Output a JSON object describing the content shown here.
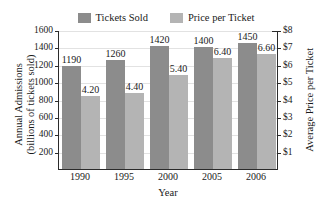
{
  "chart_data": {
    "type": "bar",
    "title": "",
    "xlabel": "Year",
    "categories": [
      "1990",
      "1995",
      "2000",
      "2005",
      "2006"
    ],
    "series": [
      {
        "name": "Tickets Sold",
        "axis": "left",
        "color": "#8c8c8c",
        "values": [
          1190,
          1260,
          1420,
          1400,
          1450
        ],
        "labels": [
          "1190",
          "1260",
          "1420",
          "1400",
          "1450"
        ]
      },
      {
        "name": "Price per Ticket",
        "axis": "right",
        "color": "#b4b4b4",
        "values": [
          4.2,
          4.4,
          5.4,
          6.4,
          6.6
        ],
        "labels": [
          "4.20",
          "4.40",
          "5.40",
          "6.40",
          "6.60"
        ]
      }
    ],
    "left_axis": {
      "label_line1": "Annual Admissions",
      "label_line2": "(billions of tickets sold)",
      "ylim": [
        0,
        1600
      ],
      "tick_values": [
        200,
        400,
        600,
        800,
        1000,
        1200,
        1400,
        1600
      ],
      "tick_labels": [
        "200",
        "400",
        "600",
        "800",
        "1000",
        "1200",
        "1400",
        "1600"
      ]
    },
    "right_axis": {
      "label": "Average Price per Ticket",
      "ylim": [
        0,
        8
      ],
      "tick_values": [
        1,
        2,
        3,
        4,
        5,
        6,
        7,
        8
      ],
      "tick_labels": [
        "$1",
        "$2",
        "$3",
        "$4",
        "$5",
        "$6",
        "$7",
        "$8"
      ]
    },
    "grid": true,
    "legend_position": "top"
  },
  "legend": {
    "items": [
      {
        "label": "Tickets Sold",
        "color": "#8c8c8c"
      },
      {
        "label": "Price per Ticket",
        "color": "#b4b4b4"
      }
    ]
  }
}
